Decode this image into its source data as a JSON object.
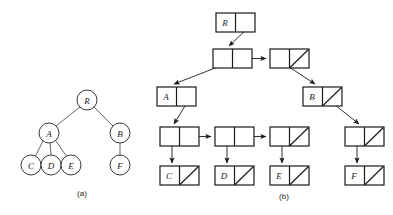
{
  "figure": {
    "title": "",
    "background": "#ffffff",
    "stroke": "#1a1a1a",
    "panels": [
      {
        "id": "a",
        "label": "(a)",
        "caption_x": 82,
        "caption_y": 196
      },
      {
        "id": "b",
        "label": "(b)",
        "caption_x": 284,
        "caption_y": 199
      }
    ]
  },
  "tree": {
    "type": "general-tree",
    "node_radius": 10,
    "nodes": [
      {
        "id": "R",
        "label": "R",
        "cx": 87,
        "cy": 100
      },
      {
        "id": "A",
        "label": "A",
        "cx": 49,
        "cy": 133
      },
      {
        "id": "B",
        "label": "B",
        "cx": 120,
        "cy": 133
      },
      {
        "id": "C",
        "label": "C",
        "cx": 31,
        "cy": 165
      },
      {
        "id": "D",
        "label": "D",
        "cx": 51,
        "cy": 165
      },
      {
        "id": "E",
        "label": "E",
        "cx": 71,
        "cy": 165
      },
      {
        "id": "F",
        "label": "F",
        "cx": 120,
        "cy": 165
      }
    ],
    "edges": [
      {
        "from": "R",
        "to": "A"
      },
      {
        "from": "R",
        "to": "B"
      },
      {
        "from": "A",
        "to": "C"
      },
      {
        "from": "A",
        "to": "D"
      },
      {
        "from": "A",
        "to": "E"
      },
      {
        "from": "B",
        "to": "F"
      }
    ]
  },
  "linked_structure": {
    "type": "left-child-right-sibling-linked-list",
    "cell_width": 39,
    "cell_height": 19,
    "boxes": [
      {
        "id": "box-R",
        "label": "R",
        "x": 216,
        "y": 13,
        "left_cell": "label",
        "right_cell": "pointer"
      },
      {
        "id": "box-r1",
        "label": "",
        "x": 213,
        "y": 49,
        "left_cell": "pointer",
        "right_cell": "pointer"
      },
      {
        "id": "box-r2",
        "label": "",
        "x": 270,
        "y": 49,
        "left_cell": "pointer",
        "right_cell": "null"
      },
      {
        "id": "box-A",
        "label": "A",
        "x": 157,
        "y": 87,
        "left_cell": "label",
        "right_cell": "pointer"
      },
      {
        "id": "box-B",
        "label": "B",
        "x": 303,
        "y": 87,
        "left_cell": "label",
        "right_cell": "null-with-link"
      },
      {
        "id": "box-c1",
        "label": "",
        "x": 160,
        "y": 127,
        "left_cell": "pointer",
        "right_cell": "pointer"
      },
      {
        "id": "box-c2",
        "label": "",
        "x": 215,
        "y": 127,
        "left_cell": "pointer",
        "right_cell": "pointer"
      },
      {
        "id": "box-c3",
        "label": "",
        "x": 270,
        "y": 127,
        "left_cell": "pointer",
        "right_cell": "null"
      },
      {
        "id": "box-c4",
        "label": "",
        "x": 345,
        "y": 127,
        "left_cell": "pointer",
        "right_cell": "null"
      },
      {
        "id": "box-C",
        "label": "C",
        "x": 160,
        "y": 166,
        "left_cell": "label",
        "right_cell": "null"
      },
      {
        "id": "box-D",
        "label": "D",
        "x": 215,
        "y": 166,
        "left_cell": "label",
        "right_cell": "null"
      },
      {
        "id": "box-E",
        "label": "E",
        "x": 270,
        "y": 166,
        "left_cell": "label",
        "right_cell": "null"
      },
      {
        "id": "box-F",
        "label": "F",
        "x": 345,
        "y": 166,
        "left_cell": "label",
        "right_cell": "null"
      }
    ],
    "arrows": [
      {
        "id": "arrow-R-to-r1",
        "from": "box-R",
        "to": "box-r1"
      },
      {
        "id": "arrow-r1-to-r2",
        "from": "box-r1",
        "to": "box-r2"
      },
      {
        "id": "arrow-r1-to-A",
        "from": "box-r1",
        "to": "box-A"
      },
      {
        "id": "arrow-r2-to-B",
        "from": "box-r2",
        "to": "box-B"
      },
      {
        "id": "arrow-A-to-c1",
        "from": "box-A",
        "to": "box-c1"
      },
      {
        "id": "arrow-B-to-c4",
        "from": "box-B",
        "to": "box-c4"
      },
      {
        "id": "arrow-c1-to-c2",
        "from": "box-c1",
        "to": "box-c2"
      },
      {
        "id": "arrow-c2-to-c3",
        "from": "box-c2",
        "to": "box-c3"
      },
      {
        "id": "arrow-c1-to-C",
        "from": "box-c1",
        "to": "box-C"
      },
      {
        "id": "arrow-c2-to-D",
        "from": "box-c2",
        "to": "box-D"
      },
      {
        "id": "arrow-c3-to-E",
        "from": "box-c3",
        "to": "box-E"
      },
      {
        "id": "arrow-c4-to-F",
        "from": "box-c4",
        "to": "box-F"
      }
    ]
  }
}
